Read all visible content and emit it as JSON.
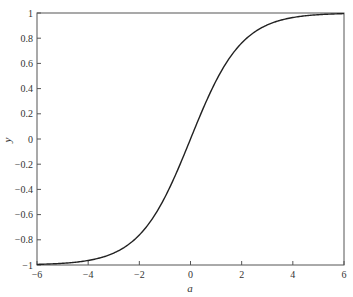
{
  "chart_data": {
    "type": "line",
    "title": "",
    "xlabel": "a",
    "ylabel": "y",
    "xlim": [
      -6,
      6
    ],
    "ylim": [
      -1,
      1
    ],
    "grid": false,
    "legend": null,
    "x_ticks": [
      -6,
      -4,
      -2,
      0,
      2,
      4,
      6
    ],
    "x_tick_labels": [
      "-6",
      "-4",
      "-2",
      "0",
      "2",
      "4",
      "6"
    ],
    "y_ticks": [
      -1,
      -0.8,
      -0.6,
      -0.4,
      -0.2,
      0,
      0.2,
      0.4,
      0.6,
      0.8,
      1
    ],
    "y_tick_labels": [
      "-1",
      "-0.8",
      "-0.6",
      "-0.4",
      "-0.2",
      "0",
      "0.2",
      "0.4",
      "0.6",
      "0.8",
      "1"
    ],
    "series": [
      {
        "name": "y = tanh(a/2)",
        "color": "#222222",
        "x": [
          -6,
          -5,
          -4,
          -3,
          -2,
          -1,
          0,
          1,
          2,
          3,
          4,
          5,
          6
        ],
        "values": [
          -0.995,
          -0.987,
          -0.964,
          -0.905,
          -0.762,
          -0.462,
          0,
          0.462,
          0.762,
          0.905,
          0.964,
          0.987,
          0.995
        ]
      }
    ]
  }
}
